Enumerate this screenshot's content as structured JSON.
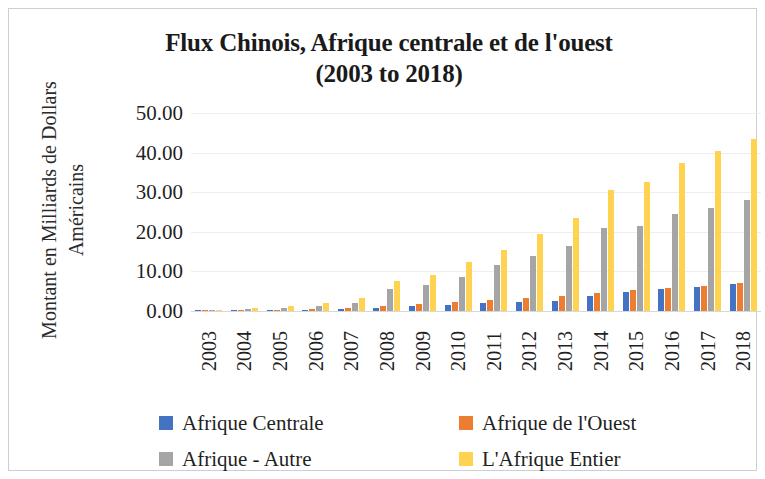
{
  "chart_data": {
    "type": "bar",
    "title": "Flux Chinois, Afrique centrale et de l'ouest (2003 to 2018)",
    "title_line1": "Flux Chinois, Afrique centrale et de l'ouest",
    "title_line2": "(2003 to 2018)",
    "xlabel": "",
    "ylabel": "Montant en Milliards de Dollars Américains",
    "ylabel_line1": "Montant en Milliards de Dollars",
    "ylabel_line2": "Américains",
    "ylim": [
      0,
      50
    ],
    "ytick_labels": [
      "50.00",
      "40.00",
      "30.00",
      "20.00",
      "10.00",
      "0.00"
    ],
    "ytick_values": [
      50,
      40,
      30,
      20,
      10,
      0
    ],
    "grid": true,
    "legend_position": "bottom",
    "categories": [
      "2003",
      "2004",
      "2005",
      "2006",
      "2007",
      "2008",
      "2009",
      "2010",
      "2011",
      "2012",
      "2013",
      "2014",
      "2015",
      "2016",
      "2017",
      "2018"
    ],
    "series": [
      {
        "name": "Afrique Centrale",
        "color": "#4573c4",
        "values": [
          0.05,
          0.1,
          0.2,
          0.3,
          0.5,
          0.8,
          1.2,
          1.5,
          2.0,
          2.3,
          2.6,
          3.8,
          4.8,
          5.5,
          6.0,
          6.8
        ]
      },
      {
        "name": "Afrique de l'Ouest",
        "color": "#ed7d31",
        "values": [
          0.05,
          0.15,
          0.3,
          0.5,
          0.8,
          1.3,
          1.8,
          2.3,
          2.9,
          3.4,
          3.9,
          4.6,
          5.3,
          5.8,
          6.4,
          7.2
        ]
      },
      {
        "name": "Afrique - Autre",
        "color": "#a5a5a5",
        "values": [
          0.2,
          0.4,
          0.8,
          1.3,
          2.0,
          5.5,
          6.5,
          8.5,
          11.5,
          14.0,
          16.5,
          21.0,
          21.5,
          24.5,
          26.0,
          28.0
        ]
      },
      {
        "name": "L'Afrique Entier",
        "color": "#ffd34f",
        "values": [
          0.3,
          0.7,
          1.3,
          2.1,
          3.3,
          7.6,
          9.0,
          12.5,
          15.5,
          19.5,
          23.5,
          30.5,
          32.5,
          37.5,
          40.5,
          43.5
        ]
      }
    ]
  },
  "legend": {
    "items": [
      {
        "label": "Afrique Centrale",
        "color": "#4573c4"
      },
      {
        "label": "Afrique de l'Ouest",
        "color": "#ed7d31"
      },
      {
        "label": "Afrique - Autre",
        "color": "#a5a5a5"
      },
      {
        "label": "L'Afrique Entier",
        "color": "#ffd34f"
      }
    ]
  }
}
